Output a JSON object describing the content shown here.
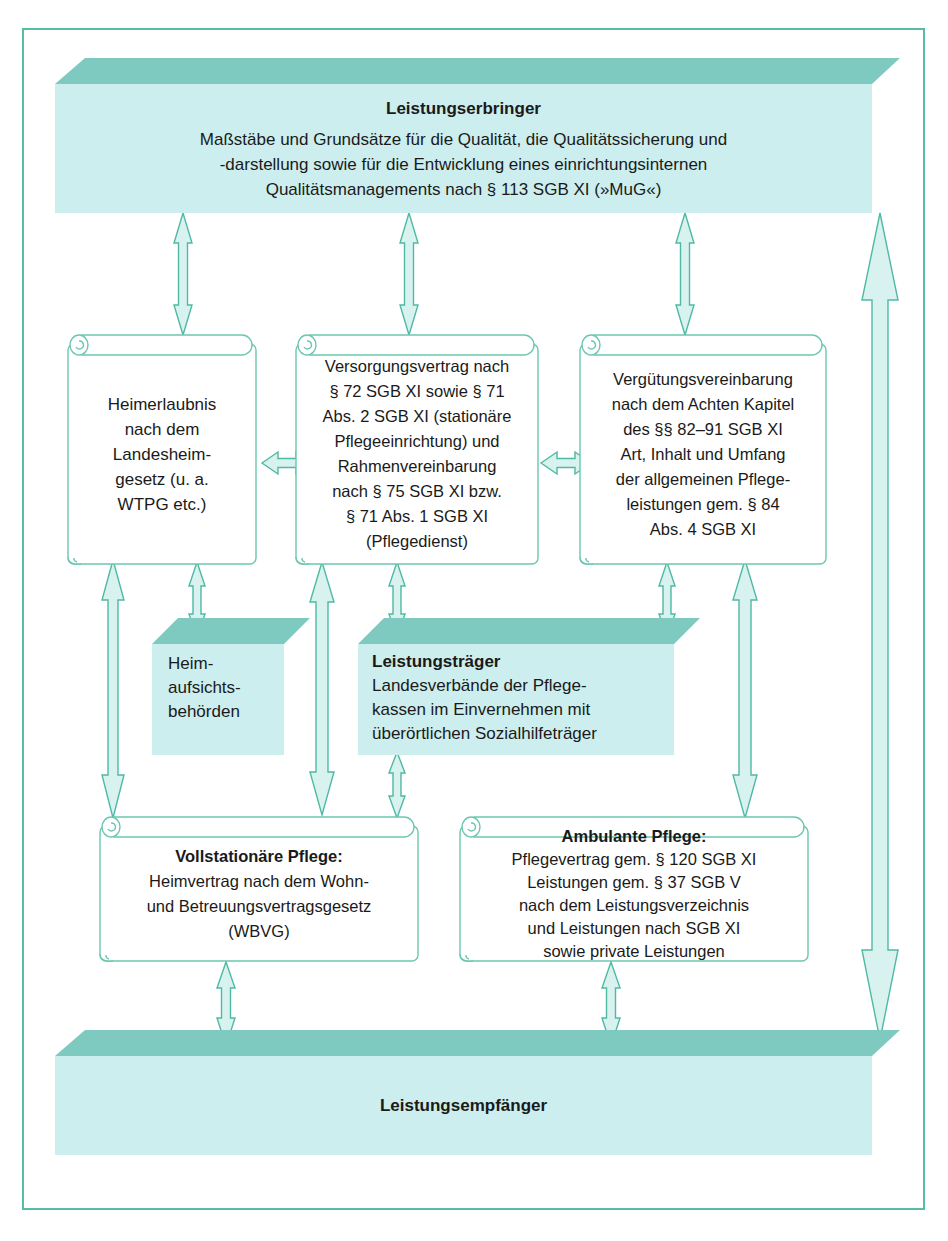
{
  "diagram": {
    "title_top": "Leistungserbringer",
    "colors": {
      "frame_border": "#57bda2",
      "banner_top": "#7ecac0",
      "banner_body": "#cdeeee",
      "arrow_fill": "#d8f2f0",
      "arrow_stroke": "#4fb9a4",
      "box_stroke": "#6cc6b0",
      "text": "#1a1a1a"
    },
    "top_banner": {
      "title": "Leistungserbringer",
      "lines": [
        "Maßstäbe und Grundsätze für die Qualität, die Qualitätssicherung und",
        "-darstellung sowie für die Entwicklung eines einrichtungsinternen",
        "Qualitätsmanagements nach § 113 SGB XI (»MuG«)"
      ]
    },
    "bottom_banner": {
      "title": "Leistungsempfänger",
      "lines": []
    },
    "middle_banners": [
      {
        "name": "heimaufsichtsbehoerden",
        "title": "",
        "lines": [
          "Heim-",
          "aufsichts-",
          "behörden"
        ]
      },
      {
        "name": "leistungstraeger",
        "title": "Leistungsträger",
        "lines": [
          "Landesverbände der Pflege-",
          "kassen im Einvernehmen mit",
          "überörtlichen Sozialhilfeträger"
        ]
      }
    ],
    "boxes": [
      {
        "name": "heimerlaubnis",
        "title": "",
        "lines": [
          "Heimerlaubnis",
          "nach dem",
          "Landesheim-",
          "gesetz (u. a.",
          "WTPG etc.)"
        ]
      },
      {
        "name": "versorgungsvertrag",
        "title": "",
        "lines": [
          "Versorgungsvertrag nach",
          "§ 72 SGB XI sowie § 71",
          "Abs. 2 SGB XI (stationäre",
          "Pflegeeinrichtung) und",
          "Rahmenvereinbarung",
          "nach § 75 SGB XI bzw.",
          "§ 71 Abs. 1 SGB XI",
          "(Pflegedienst)"
        ]
      },
      {
        "name": "verguetungsvereinbarung",
        "title": "",
        "lines": [
          "Vergütungsvereinbarung",
          "nach dem Achten Kapitel",
          "des §§ 82–91 SGB XI",
          "Art, Inhalt und Umfang",
          "der allgemeinen Pflege-",
          "leistungen gem. § 84",
          "Abs. 4 SGB XI"
        ]
      },
      {
        "name": "vollstationaere-pflege",
        "title": "Vollstationäre Pflege:",
        "lines": [
          "Heimvertrag nach dem Wohn-",
          "und Betreuungsvertragsgesetz",
          "(WBVG)"
        ]
      },
      {
        "name": "ambulante-pflege",
        "title": "Ambulante Pflege:",
        "lines": [
          "Pflegevertrag gem. § 120 SGB XI",
          "Leistungen gem. § 37 SGB V",
          "nach dem Leistungsverzeichnis",
          "und Leistungen nach SGB XI",
          "sowie private Leistungen"
        ]
      }
    ],
    "caption": ""
  }
}
